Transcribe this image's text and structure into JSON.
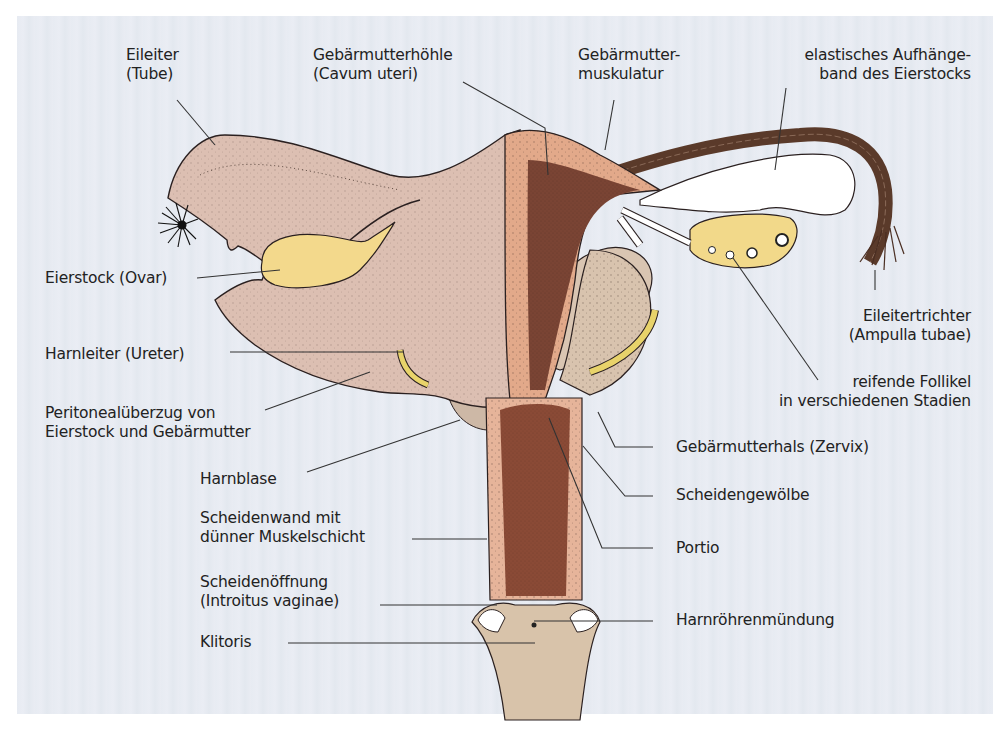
{
  "diagram": {
    "type": "anatomical-illustration",
    "colors": {
      "background": "#e8ecf3",
      "peritoneum": "#dcbfb0",
      "muscle": "#e2a98a",
      "cavity": "#7a4434",
      "ovary": "#f2d88a",
      "ureter": "#e8d36a",
      "ligament_fibers": "#5a3a2a",
      "vagina": "#8a4a36",
      "vulva": "#d8c3aa",
      "bladder": "#d8c4b0",
      "leader_line": "#333333",
      "text": "#222222"
    }
  },
  "labels": {
    "eileiter": {
      "line1": "Eileiter",
      "line2": "(Tube)"
    },
    "gebaermutterhoehle": {
      "line1": "Gebärmutterhöhle",
      "line2": "(Cavum uteri)"
    },
    "gebaermuttermuskulatur": {
      "line1": "Gebärmutter-",
      "line2": "muskulatur"
    },
    "aufhaengeband": {
      "line1": "elastisches Aufhänge-",
      "line2": "band des Eierstocks"
    },
    "eierstock": {
      "line1": "Eierstock (Ovar)"
    },
    "eileitertrichter": {
      "line1": "Eileitertrichter",
      "line2": "(Ampulla tubae)"
    },
    "harnleiter": {
      "line1": "Harnleiter (Ureter)"
    },
    "follikel": {
      "line1": "reifende Follikel",
      "line2": "in verschiedenen Stadien"
    },
    "peritoneal": {
      "line1": "Peritonealüberzug von",
      "line2": "Eierstock und Gebärmutter"
    },
    "zervix": {
      "line1": "Gebärmutterhals (Zervix)"
    },
    "harnblase": {
      "line1": "Harnblase"
    },
    "scheidengewoelbe": {
      "line1": "Scheidengewölbe"
    },
    "scheidenwand": {
      "line1": "Scheidenwand mit",
      "line2": "dünner Muskelschicht"
    },
    "portio": {
      "line1": "Portio"
    },
    "scheidenoeffnung": {
      "line1": "Scheidenöffnung",
      "line2": "(Introitus vaginae)"
    },
    "harnroehrenmuendung": {
      "line1": "Harnröhrenmündung"
    },
    "klitoris": {
      "line1": "Klitoris"
    }
  }
}
